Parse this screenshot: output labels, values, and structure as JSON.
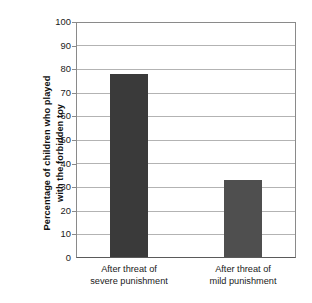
{
  "chart_data": {
    "type": "bar",
    "title": "",
    "subtitle": "",
    "xlabel": "",
    "ylabel": "Percentage of children who played with the forbidden toy",
    "ylabel_lines": [
      "Percentage of children who played",
      "with the forbidden toy"
    ],
    "categories": [
      "After threat of severe punishment",
      "After threat of mild punishment"
    ],
    "category_lines": [
      [
        "After threat of",
        "severe punishment"
      ],
      [
        "After threat of",
        "mild punishment"
      ]
    ],
    "values": [
      78,
      33
    ],
    "ylim": [
      0,
      100
    ],
    "ytick_step": 10,
    "yticks": [
      100,
      90,
      80,
      70,
      60,
      50,
      40,
      30,
      20,
      10,
      0
    ],
    "ytick_labels": [
      "100",
      "90",
      "80",
      "70",
      "60",
      "50",
      "40",
      "30",
      "20",
      "10",
      "0"
    ],
    "grid": true,
    "grid_axis": "y",
    "legend": false,
    "legend_position": "none",
    "bar_colors": [
      "#3a3a3a",
      "#4f4f4f"
    ],
    "bars": [
      {
        "category": "After threat of severe punishment",
        "value": 78,
        "color": "#3a3a3a"
      },
      {
        "category": "After threat of mild punishment",
        "value": 33,
        "color": "#4f4f4f"
      }
    ]
  },
  "colors": {
    "background": "#ffffff",
    "gridline": "#b3b3b3",
    "axis": "#8a8a8a",
    "baseline": "#5a5a5a",
    "text": "#1a1a1a",
    "bar_severe": "#3a3a3a",
    "bar_mild": "#4f4f4f"
  }
}
